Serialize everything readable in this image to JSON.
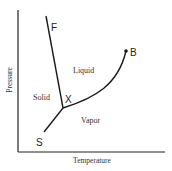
{
  "diagram": {
    "type": "phase-diagram",
    "axes": {
      "x_label": "Temperature",
      "y_label": "Pressure"
    },
    "regions": {
      "solid": "Solid",
      "liquid": "Liquid",
      "vapor": "Vapor"
    },
    "points": {
      "fusion_end": "F",
      "critical_point": "B",
      "triple_point": "X",
      "sublimation_end": "S"
    },
    "curves": [
      {
        "name": "fusion-curve",
        "from": "X",
        "to": "F"
      },
      {
        "name": "vaporization-curve",
        "from": "X",
        "to": "B"
      },
      {
        "name": "sublimation-curve",
        "from": "X",
        "to": "S"
      }
    ],
    "colors": {
      "line": "#1a1a1a",
      "background": "#ffffff"
    }
  }
}
